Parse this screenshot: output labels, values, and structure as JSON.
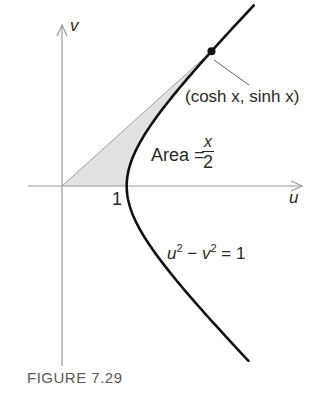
{
  "figure": {
    "caption": "FIGURE 7.29",
    "axes": {
      "u_label": "u",
      "v_label": "v",
      "tick_one_label": "1"
    },
    "point_label": "(cosh x, sinh x)",
    "area_label": {
      "prefix": "Area =",
      "numerator": "x",
      "denominator": "2"
    },
    "equation": {
      "u": "u",
      "u_exp": "2",
      "minus": " − ",
      "v": "v",
      "v_exp": "2",
      "rest": " = 1"
    },
    "colors": {
      "curve": "#111111",
      "axes": "#9a9a9a",
      "shade": "#e2e2e2",
      "leader": "#666666",
      "text": "#2a2a2a",
      "caption": "#5a5a5a"
    }
  },
  "chart_data": {
    "type": "diagram",
    "xlabel": "u",
    "ylabel": "v",
    "curve": {
      "equation": "u^2 - v^2 = 1",
      "branch": "right",
      "param_t_range": [
        -1.72,
        1.75
      ]
    },
    "marked_point": {
      "label": "(cosh x, sinh x)",
      "u": 2.27,
      "v": 2.04,
      "param_x": 1.48
    },
    "tick_labels": [
      {
        "u": 1,
        "label": "1"
      }
    ],
    "shaded_region": {
      "description": "Sector bounded by segment from origin to (cosh x, sinh x), the hyperbola, and the u-axis",
      "area_label": "x/2"
    },
    "xlim": [
      -0.53,
      3.7
    ],
    "ylim": [
      -2.78,
      2.49
    ],
    "grid": false
  }
}
